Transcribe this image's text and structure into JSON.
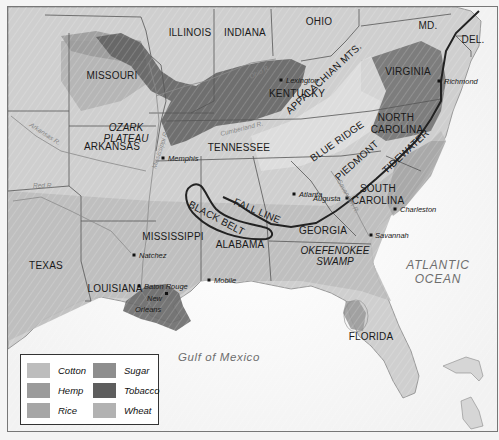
{
  "map": {
    "title": "Crops of the American South",
    "states": [
      {
        "name": "ILLINOIS",
        "x": 189,
        "y": 35
      },
      {
        "name": "INDIANA",
        "x": 244,
        "y": 35
      },
      {
        "name": "OHIO",
        "x": 318,
        "y": 24
      },
      {
        "name": "MD.",
        "x": 427,
        "y": 28
      },
      {
        "name": "DEL.",
        "x": 472,
        "y": 42
      },
      {
        "name": "MISSOURI",
        "x": 111,
        "y": 78
      },
      {
        "name": "KENTUCKY",
        "x": 296,
        "y": 96
      },
      {
        "name": "VIRGINIA",
        "x": 407,
        "y": 74
      },
      {
        "name": "NORTH",
        "x": 395,
        "y": 120
      },
      {
        "name": "CAROLINA",
        "x": 396,
        "y": 132
      },
      {
        "name": "ARKANSAS",
        "x": 111,
        "y": 149
      },
      {
        "name": "TENNESSEE",
        "x": 238,
        "y": 150
      },
      {
        "name": "SOUTH",
        "x": 377,
        "y": 191
      },
      {
        "name": "CAROLINA",
        "x": 377,
        "y": 203
      },
      {
        "name": "GEORGIA",
        "x": 322,
        "y": 233
      },
      {
        "name": "MISSISSIPPI",
        "x": 172,
        "y": 239
      },
      {
        "name": "ALABAMA",
        "x": 239,
        "y": 247
      },
      {
        "name": "TEXAS",
        "x": 45,
        "y": 268
      },
      {
        "name": "LOUISIANA",
        "x": 114,
        "y": 291
      },
      {
        "name": "FLORIDA",
        "x": 370,
        "y": 339
      }
    ],
    "regions": [
      {
        "name": "OZARK",
        "x": 125,
        "y": 130
      },
      {
        "name": "PLATEAU",
        "x": 125,
        "y": 141
      },
      {
        "name": "OKEFENOKEE",
        "x": 334,
        "y": 253
      },
      {
        "name": "SWAMP",
        "x": 334,
        "y": 264
      }
    ],
    "rotated_labels": [
      {
        "name": "APPALACHIAN MTS.",
        "x": 325,
        "y": 80,
        "rotate": -43
      },
      {
        "name": "BLUE RIDGE",
        "x": 338,
        "y": 143,
        "rotate": -35
      },
      {
        "name": "PIEDMONT",
        "x": 358,
        "y": 162,
        "rotate": -42
      },
      {
        "name": "TIDEWATER",
        "x": 407,
        "y": 153,
        "rotate": -43
      },
      {
        "name": "FALL LINE",
        "x": 255,
        "y": 213,
        "rotate": 23
      },
      {
        "name": "BLACK BELT",
        "x": 214,
        "y": 220,
        "rotate": 28
      }
    ],
    "cities": [
      {
        "name": "Lexington",
        "x": 280,
        "y": 79,
        "dx": 5
      },
      {
        "name": "Richmond",
        "x": 438,
        "y": 80,
        "dx": 5
      },
      {
        "name": "Memphis",
        "x": 162,
        "y": 157,
        "dx": 5
      },
      {
        "name": "Atlanta",
        "x": 293,
        "y": 193,
        "dx": 5
      },
      {
        "name": "Augusta",
        "x": 346,
        "y": 197,
        "dx": -34
      },
      {
        "name": "Charleston",
        "x": 394,
        "y": 208,
        "dx": 5
      },
      {
        "name": "Savannah",
        "x": 370,
        "y": 234,
        "dx": 4
      },
      {
        "name": "Natchez",
        "x": 133,
        "y": 254,
        "dx": 5
      },
      {
        "name": "Baton Rouge",
        "x": 138,
        "y": 285,
        "dx": 5
      },
      {
        "name": "New",
        "x": 163,
        "y": 297,
        "dx": -17
      },
      {
        "name": "Orleans",
        "x": 163,
        "y": 308,
        "dx": -29
      },
      {
        "name": "Mobile",
        "x": 208,
        "y": 279,
        "dx": 5
      }
    ],
    "rivers": [
      {
        "name": "Ohio R.",
        "x": 250,
        "y": 78,
        "rotate": -28
      },
      {
        "name": "Cumberland R.",
        "x": 220,
        "y": 135,
        "rotate": -14
      },
      {
        "name": "Arkansas R.",
        "x": 28,
        "y": 125,
        "rotate": 33
      },
      {
        "name": "Red R.",
        "x": 32,
        "y": 187,
        "rotate": 0
      },
      {
        "name": "Mississippi R.",
        "x": 155,
        "y": 168,
        "rotate": -72
      },
      {
        "name": "Savannah R.",
        "x": 336,
        "y": 180,
        "rotate": 60
      }
    ],
    "water_bodies": {
      "atlantic_line1": "ATLANTIC",
      "atlantic_line2": "OCEAN",
      "gulf": "Gulf of Mexico"
    }
  },
  "legend": {
    "items": [
      {
        "label": "Cotton",
        "color": "#bdbdbd"
      },
      {
        "label": "Hemp",
        "color": "#9b9b9b"
      },
      {
        "label": "Rice",
        "color": "#a6a6a6"
      },
      {
        "label": "Sugar",
        "color": "#8e8e8e"
      },
      {
        "label": "Tobacco",
        "color": "#5e5e5e"
      },
      {
        "label": "Wheat",
        "color": "#b2b2b2"
      }
    ]
  }
}
